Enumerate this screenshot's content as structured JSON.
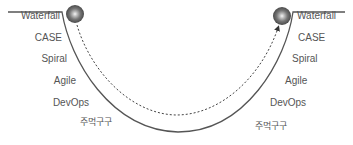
{
  "diagram": {
    "type": "u-curve-methodology-cycle",
    "colors": {
      "curve": "#555555",
      "dashed": "#444444",
      "text": "#555555",
      "ball_dark": "#555555",
      "ball_light": "#f5f5f5"
    },
    "left_labels": [
      "Waterfall",
      "CASE",
      "Spiral",
      "Agile",
      "DevOps",
      "주먹구구"
    ],
    "right_labels": [
      "Waterfall",
      "CASE",
      "Spiral",
      "Agile",
      "DevOps",
      "주먹구구"
    ],
    "left_ball": {
      "icon": "ball-icon"
    },
    "right_ball": {
      "icon": "ball-icon"
    },
    "path": {
      "style": "dashed",
      "direction": "left-to-right",
      "end_marker": "arrow-icon"
    }
  }
}
